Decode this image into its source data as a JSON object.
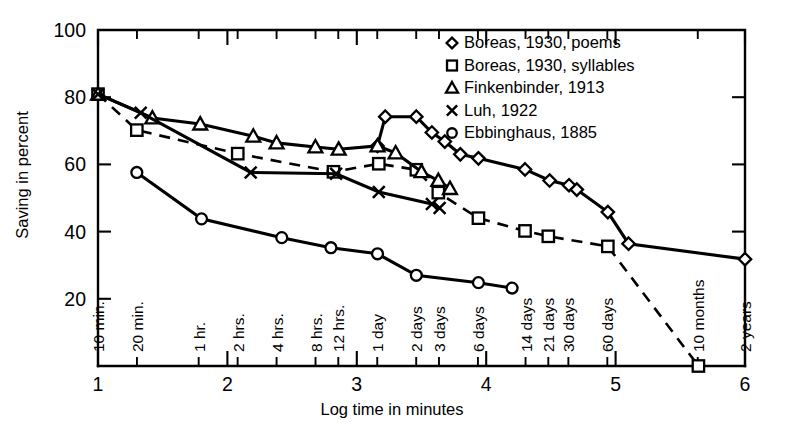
{
  "chart_data": {
    "type": "line",
    "title": "",
    "xlabel": "Log time in minutes",
    "ylabel": "Saving in percent",
    "xlim": [
      1,
      6
    ],
    "ylim": [
      0,
      100
    ],
    "grid": false,
    "legend_position": "top-right",
    "y_ticks": [
      20,
      40,
      60,
      80,
      100
    ],
    "x_ticks": [
      1,
      2,
      3,
      4,
      5,
      6
    ],
    "x_time_ticks": [
      {
        "label": "10 min.",
        "x": 1.0
      },
      {
        "label": "20 min.",
        "x": 1.301
      },
      {
        "label": "1 hr.",
        "x": 1.778
      },
      {
        "label": "2 hrs.",
        "x": 2.079
      },
      {
        "label": "4 hrs.",
        "x": 2.38
      },
      {
        "label": "8 hrs.",
        "x": 2.681
      },
      {
        "label": "12 hrs.",
        "x": 2.857
      },
      {
        "label": "1 day",
        "x": 3.158
      },
      {
        "label": "2 days",
        "x": 3.459
      },
      {
        "label": "3 days",
        "x": 3.635
      },
      {
        "label": "6 days",
        "x": 3.936
      },
      {
        "label": "14 days",
        "x": 4.304
      },
      {
        "label": "21 days",
        "x": 4.48
      },
      {
        "label": "30 days",
        "x": 4.635
      },
      {
        "label": "60 days",
        "x": 4.936
      },
      {
        "label": "10 months",
        "x": 5.635
      },
      {
        "label": "2 years",
        "x": 6.0
      }
    ],
    "series": [
      {
        "name": "Boreas, 1930, poems",
        "marker": "diamond",
        "linestyle": "solid",
        "points": [
          [
            3.16,
            65.5
          ],
          [
            3.22,
            74.2
          ],
          [
            3.46,
            74.2
          ],
          [
            3.58,
            69.5
          ],
          [
            3.68,
            66.8
          ],
          [
            3.8,
            63.0
          ],
          [
            3.94,
            61.8
          ],
          [
            4.3,
            58.5
          ],
          [
            4.49,
            55.2
          ],
          [
            4.64,
            53.8
          ],
          [
            4.7,
            52.5
          ],
          [
            4.94,
            45.8
          ],
          [
            5.1,
            36.4
          ],
          [
            6.0,
            31.8
          ]
        ]
      },
      {
        "name": "Boreas, 1930, syllables",
        "marker": "square",
        "linestyle": "dashed",
        "points": [
          [
            1.0,
            80.9
          ],
          [
            1.3,
            70.2
          ],
          [
            2.08,
            63.2
          ],
          [
            2.82,
            57.8
          ],
          [
            3.17,
            60.2
          ],
          [
            3.46,
            58.4
          ],
          [
            3.63,
            51.6
          ],
          [
            3.94,
            44.0
          ],
          [
            4.3,
            40.2
          ],
          [
            4.48,
            38.6
          ],
          [
            4.94,
            35.6
          ],
          [
            5.64,
            0.0
          ]
        ]
      },
      {
        "name": "Finkenbinder, 1913",
        "marker": "triangle",
        "linestyle": "solid",
        "points": [
          [
            1.0,
            80.9
          ],
          [
            1.42,
            73.8
          ],
          [
            1.79,
            72.0
          ],
          [
            2.2,
            68.4
          ],
          [
            2.38,
            66.4
          ],
          [
            2.68,
            65.2
          ],
          [
            2.86,
            64.5
          ],
          [
            3.16,
            65.5
          ],
          [
            3.3,
            63.4
          ],
          [
            3.5,
            57.8
          ],
          [
            3.63,
            55.2
          ],
          [
            3.72,
            52.8
          ]
        ]
      },
      {
        "name": "Luh, 1922",
        "marker": "x",
        "linestyle": "solid",
        "points": [
          [
            1.0,
            80.9
          ],
          [
            1.33,
            75.4
          ],
          [
            2.18,
            57.6
          ],
          [
            2.84,
            57.2
          ],
          [
            3.17,
            51.8
          ],
          [
            3.58,
            48.2
          ],
          [
            3.64,
            47.0
          ]
        ]
      },
      {
        "name": "Ebbinghaus, 1885",
        "marker": "circle",
        "linestyle": "solid",
        "points": [
          [
            1.3,
            57.6
          ],
          [
            1.8,
            43.8
          ],
          [
            2.42,
            38.2
          ],
          [
            2.8,
            35.2
          ],
          [
            3.16,
            33.4
          ],
          [
            3.46,
            27.0
          ],
          [
            3.94,
            24.8
          ],
          [
            4.2,
            23.2
          ]
        ]
      }
    ]
  },
  "legend": {
    "entries": [
      {
        "marker": "diamond",
        "label": "Boreas, 1930, poems"
      },
      {
        "marker": "square",
        "label": "Boreas, 1930, syllables"
      },
      {
        "marker": "triangle",
        "label": "Finkenbinder, 1913"
      },
      {
        "marker": "x",
        "label": "Luh, 1922"
      },
      {
        "marker": "circle",
        "label": "Ebbinghaus, 1885"
      }
    ]
  },
  "colors": {
    "ink": "#000000",
    "background": "#ffffff"
  }
}
